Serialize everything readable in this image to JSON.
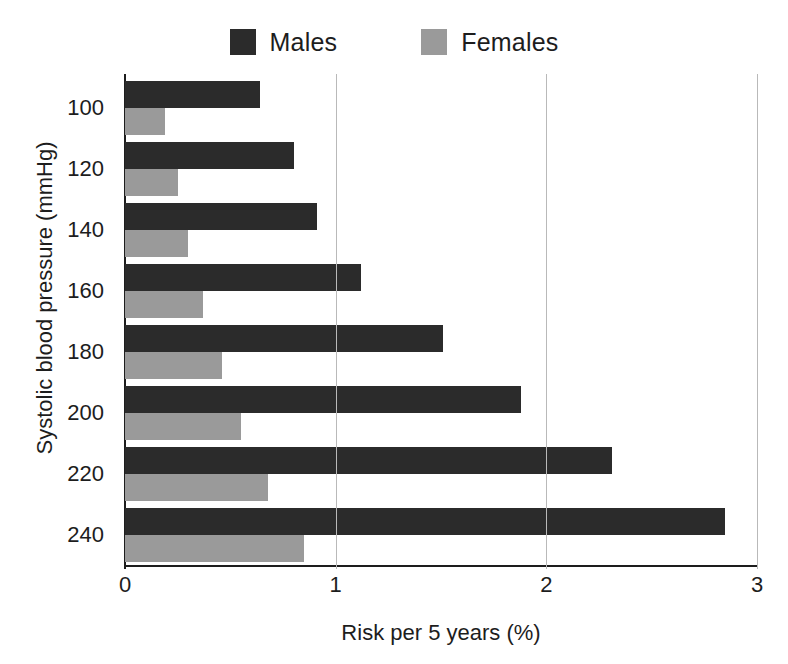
{
  "chart_data": {
    "type": "bar",
    "orientation": "horizontal",
    "title": "",
    "xlabel": "Risk per 5 years (%)",
    "ylabel": "Systolic blood pressure  (mmHg)",
    "categories": [
      "100",
      "120",
      "140",
      "160",
      "180",
      "200",
      "220",
      "240"
    ],
    "series": [
      {
        "name": "Males",
        "color": "#2b2b2b",
        "values": [
          0.64,
          0.8,
          0.91,
          1.12,
          1.51,
          1.88,
          2.31,
          2.85
        ]
      },
      {
        "name": "Females",
        "color": "#9a9a9a",
        "values": [
          0.19,
          0.25,
          0.3,
          0.37,
          0.46,
          0.55,
          0.68,
          0.85
        ]
      }
    ],
    "xlim": [
      0,
      3
    ],
    "xticks": [
      "0",
      "1",
      "2",
      "3"
    ],
    "xtick_values": [
      0,
      1,
      2,
      3
    ],
    "grid": "vertical-only",
    "legend_position": "top-center"
  },
  "legend": {
    "entries": [
      {
        "label": "Males",
        "color": "#2b2b2b",
        "swatch_name": "legend-swatch-males"
      },
      {
        "label": "Females",
        "color": "#9a9a9a",
        "swatch_name": "legend-swatch-females"
      }
    ]
  },
  "axes": {
    "y_title": "Systolic blood pressure  (mmHg)",
    "x_title": "Risk per 5 years (%)"
  },
  "colors": {
    "males": "#2b2b2b",
    "females": "#9a9a9a",
    "axis": "#1d1d1d",
    "grid": "#b9b9b9",
    "background": "#ffffff"
  }
}
